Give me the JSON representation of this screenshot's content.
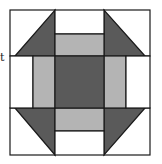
{
  "diagram": {
    "type": "quilt-block",
    "stray_text": "t",
    "colors": {
      "dark": "#5a5a5a",
      "light": "#b4b4b4",
      "white": "#ffffff",
      "stroke": "#1a1a1a"
    }
  }
}
